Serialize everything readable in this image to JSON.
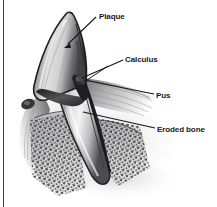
{
  "figure": {
    "kind": "medical-illustration",
    "style": "grayscale pen-and-ink shaded drawing",
    "background_color": "#ffffff",
    "border_color": "#3a3a3a",
    "ink_color": "#18181a"
  },
  "labels": [
    {
      "id": "plaque",
      "text": "Plaque",
      "leader_from": [
        96,
        17
      ],
      "leader_to": [
        66,
        45
      ]
    },
    {
      "id": "calculus",
      "text": "Calculus",
      "leader_from": [
        123,
        60
      ],
      "leader_to": [
        80,
        79
      ]
    },
    {
      "id": "pus",
      "text": "Pus",
      "leader_from": [
        154,
        95
      ],
      "leader_to": [
        82,
        80
      ]
    },
    {
      "id": "eroded_bone",
      "text": "Eroded bone",
      "leader_from": [
        155,
        129
      ],
      "leader_to": [
        82,
        113
      ]
    }
  ],
  "anatomy": [
    {
      "id": "crown",
      "name": "tooth crown"
    },
    {
      "id": "root",
      "name": "tooth root"
    },
    {
      "id": "gum",
      "name": "gingival tissue"
    },
    {
      "id": "bone",
      "name": "alveolar bone with stipple texture"
    },
    {
      "id": "pocket",
      "name": "periodontal pocket"
    }
  ]
}
